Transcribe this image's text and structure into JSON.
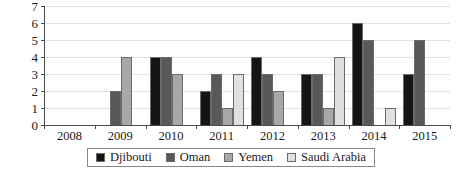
{
  "chart_data": {
    "type": "bar",
    "title": "",
    "subtitle": "",
    "xlabel": "",
    "ylabel": "",
    "categories": [
      "2008",
      "2009",
      "2010",
      "2011",
      "2012",
      "2013",
      "2014",
      "2015"
    ],
    "series": [
      {
        "name": "Djibouti",
        "color": "#151515",
        "values": [
          0,
          0,
          4,
          2,
          4,
          3,
          6,
          3
        ]
      },
      {
        "name": "Oman",
        "color": "#595959",
        "values": [
          0,
          2,
          4,
          3,
          3,
          3,
          5,
          5
        ]
      },
      {
        "name": "Yemen",
        "color": "#a8a8a8",
        "values": [
          0,
          4,
          3,
          1,
          2,
          1,
          0,
          0
        ]
      },
      {
        "name": "Saudi Arabia",
        "color": "#e0e0e0",
        "values": [
          0,
          0,
          0,
          3,
          0,
          4,
          1,
          0
        ]
      }
    ],
    "ylim": [
      0,
      7
    ],
    "y_ticks": [
      "0",
      "1",
      "2",
      "3",
      "4",
      "5",
      "6",
      "7"
    ],
    "grid": true,
    "legend_position": "bottom",
    "legend": [
      "Djibouti",
      "Oman",
      "Yemen",
      "Saudi Arabia"
    ]
  },
  "colors": {
    "axis": "#4a4a4a",
    "gridline": "#e3e3e3",
    "bar_outline": "#6b6b6b",
    "legend_border": "#888888",
    "background": "#ffffff"
  }
}
